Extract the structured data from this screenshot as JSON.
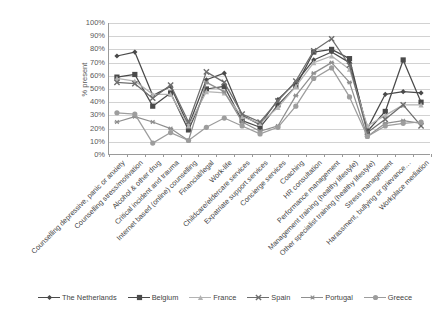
{
  "chart_data": {
    "type": "line",
    "title": "",
    "xlabel": "",
    "ylabel": "% present",
    "ylim": [
      0,
      100
    ],
    "ytick_labels": [
      "100%",
      "90%",
      "80%",
      "70%",
      "60%",
      "50%",
      "40%",
      "30%",
      "20%",
      "10%",
      "0%"
    ],
    "ytick_values": [
      100,
      90,
      80,
      70,
      60,
      50,
      40,
      30,
      20,
      10,
      0
    ],
    "grid": true,
    "legend_position": "bottom",
    "categories": [
      "Counselling depressive, panic or anxiety",
      "Counselling stress/motivation",
      "Alcohol & other drug",
      "Critical incident and trauma",
      "Internet based (online) counselling",
      "Financial/legal",
      "Work-life",
      "Childcare/eldercare services",
      "Expatriate support services",
      "Concierge services",
      "Coaching",
      "HR consultation",
      "Performance management",
      "Management training (healthy lifestyle)",
      "Other specialist training (healthy lifestyle)",
      "Stress management",
      "Harassment, bullying or grievance…",
      "Workplace mediation"
    ],
    "series": [
      {
        "name": "The Netherlands",
        "color": "#4a4a4a",
        "marker": "diamond",
        "values": [
          75,
          78,
          45,
          52,
          22,
          57,
          62,
          30,
          23,
          42,
          55,
          72,
          78,
          70,
          20,
          46,
          48,
          47
        ]
      },
      {
        "name": "Belgium",
        "color": "#4a4a4a",
        "marker": "square",
        "values": [
          59,
          61,
          37,
          47,
          19,
          50,
          52,
          26,
          21,
          38,
          52,
          78,
          80,
          73,
          18,
          33,
          72,
          40
        ]
      },
      {
        "name": "France",
        "color": "#b3b3b3",
        "marker": "triangle",
        "values": [
          58,
          56,
          46,
          46,
          22,
          48,
          47,
          29,
          24,
          36,
          52,
          70,
          75,
          65,
          22,
          30,
          38,
          38
        ]
      },
      {
        "name": "Spain",
        "color": "#6e6e6e",
        "marker": "x",
        "values": [
          55,
          54,
          43,
          53,
          25,
          63,
          55,
          31,
          25,
          41,
          56,
          79,
          88,
          68,
          17,
          27,
          38,
          22
        ]
      },
      {
        "name": "Portugal",
        "color": "#8f8f8f",
        "marker": "star",
        "values": [
          25,
          29,
          25,
          20,
          11,
          55,
          48,
          25,
          18,
          22,
          45,
          62,
          70,
          55,
          14,
          24,
          26,
          24
        ]
      },
      {
        "name": "Greece",
        "color": "#9d9d9d",
        "marker": "circle",
        "values": [
          32,
          31,
          9,
          17,
          11,
          21,
          28,
          22,
          16,
          21,
          37,
          58,
          66,
          44,
          14,
          22,
          24,
          25
        ]
      }
    ]
  }
}
